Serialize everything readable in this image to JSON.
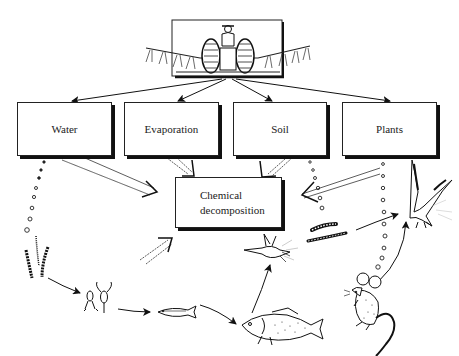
{
  "diagram": {
    "title_image": "tractor-sprayer",
    "nodes": {
      "source": {
        "label": "",
        "icon": "tractor-sprayer-icon"
      },
      "water": {
        "label": "Water"
      },
      "evaporation": {
        "label": "Evaporation"
      },
      "soil": {
        "label": "Soil"
      },
      "plants": {
        "label": "Plants"
      },
      "decomposition": {
        "line1": "Chemical",
        "line2": "decomposition"
      }
    },
    "organisms": [
      {
        "name": "algae",
        "icon": "aquatic-plant-icon"
      },
      {
        "name": "zooplankton",
        "icon": "zooplankton-icon"
      },
      {
        "name": "small-fish",
        "icon": "small-fish-icon"
      },
      {
        "name": "large-fish",
        "icon": "large-fish-icon"
      },
      {
        "name": "heron",
        "icon": "fishing-bird-icon"
      },
      {
        "name": "worms",
        "icon": "earthworm-icon"
      },
      {
        "name": "mouse",
        "icon": "mouse-icon"
      },
      {
        "name": "hawk",
        "icon": "bird-of-prey-icon"
      }
    ],
    "edges": [
      [
        "source",
        "water"
      ],
      [
        "source",
        "evaporation"
      ],
      [
        "source",
        "soil"
      ],
      [
        "source",
        "plants"
      ],
      [
        "water",
        "decomposition"
      ],
      [
        "evaporation",
        "decomposition"
      ],
      [
        "soil",
        "decomposition"
      ],
      [
        "plants",
        "decomposition"
      ],
      [
        "water",
        "algae"
      ],
      [
        "algae",
        "zooplankton"
      ],
      [
        "zooplankton",
        "small-fish"
      ],
      [
        "small-fish",
        "large-fish"
      ],
      [
        "large-fish",
        "heron"
      ],
      [
        "soil",
        "worms"
      ],
      [
        "worms",
        "hawk"
      ],
      [
        "plants",
        "mouse"
      ],
      [
        "mouse",
        "hawk"
      ]
    ]
  }
}
